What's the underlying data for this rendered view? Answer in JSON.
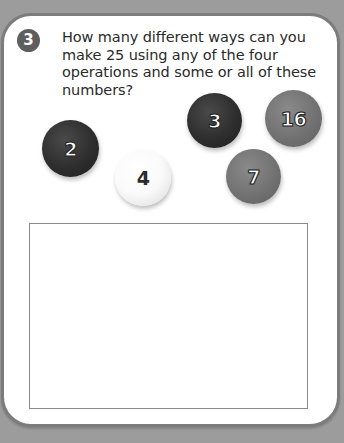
{
  "question": {
    "number": "3",
    "text": "How many different ways can you make 25 using any of the four operations and some or all of these numbers?"
  },
  "balls": [
    {
      "label": "2",
      "shade": "dark"
    },
    {
      "label": "4",
      "shade": "light"
    },
    {
      "label": "3",
      "shade": "dark"
    },
    {
      "label": "16",
      "shade": "mid"
    },
    {
      "label": "7",
      "shade": "mid"
    }
  ],
  "answer_box": {
    "value": ""
  },
  "colors": {
    "background": "#9c9c9c",
    "card_border": "#7c7c7c",
    "badge": "#5e5e5e",
    "ball_dark": "#2e2e2e",
    "ball_mid": "#727272",
    "ball_light": "#fafafa"
  }
}
